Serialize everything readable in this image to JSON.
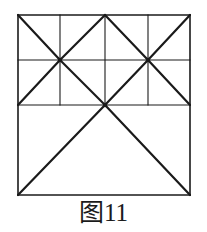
{
  "figure": {
    "caption_cjk": "图",
    "caption_number": "11",
    "caption_full": "图11",
    "stroke_color": "#1a1a1a",
    "background_color": "#ffffff",
    "thin_stroke_width": 1.1,
    "thick_stroke_width": 2.2,
    "outer_square": {
      "left": 18,
      "top": 15,
      "right": 190,
      "bottom": 195,
      "width": 172,
      "height": 180
    },
    "grid": {
      "vertical_x": [
        18,
        60,
        105,
        148,
        190
      ],
      "horizontal_y": [
        15,
        60,
        105,
        195
      ]
    },
    "nodes": [
      {
        "name": "node-upper-left",
        "x": 60,
        "y": 60,
        "degree": 8
      },
      {
        "name": "node-upper-right",
        "x": 148,
        "y": 60,
        "degree": 8
      },
      {
        "name": "node-center-apex",
        "x": 105,
        "y": 105,
        "degree": 6
      }
    ],
    "segments": {
      "outline": [
        {
          "name": "outer-top",
          "x1": 18,
          "y1": 15,
          "x2": 190,
          "y2": 15
        },
        {
          "name": "outer-bottom",
          "x1": 18,
          "y1": 195,
          "x2": 190,
          "y2": 195
        },
        {
          "name": "outer-left",
          "x1": 18,
          "y1": 15,
          "x2": 18,
          "y2": 195
        },
        {
          "name": "outer-right",
          "x1": 190,
          "y1": 15,
          "x2": 190,
          "y2": 195
        }
      ],
      "horizontals": [
        {
          "name": "mid-upper-horizontal",
          "x1": 18,
          "y1": 60,
          "x2": 190,
          "y2": 60
        },
        {
          "name": "mid-lower-horizontal",
          "x1": 18,
          "y1": 105,
          "x2": 190,
          "y2": 105
        }
      ],
      "verticals": [
        {
          "name": "vertical-col-1-upper",
          "x1": 60,
          "y1": 15,
          "x2": 60,
          "y2": 105
        },
        {
          "name": "vertical-col-2-upper",
          "x1": 105,
          "y1": 15,
          "x2": 105,
          "y2": 105
        },
        {
          "name": "vertical-col-3-upper",
          "x1": 148,
          "y1": 15,
          "x2": 148,
          "y2": 105
        }
      ],
      "diagonals": [
        {
          "name": "diag-tl-corner-to-node1",
          "x1": 18,
          "y1": 15,
          "x2": 60,
          "y2": 60
        },
        {
          "name": "diag-node1-to-top-mid",
          "x1": 60,
          "y1": 60,
          "x2": 105,
          "y2": 15
        },
        {
          "name": "diag-top-mid-to-node2",
          "x1": 105,
          "y1": 15,
          "x2": 148,
          "y2": 60
        },
        {
          "name": "diag-node2-to-tr-corner",
          "x1": 148,
          "y1": 60,
          "x2": 190,
          "y2": 15
        },
        {
          "name": "diag-node1-to-left-lower",
          "x1": 60,
          "y1": 60,
          "x2": 18,
          "y2": 105
        },
        {
          "name": "diag-node1-to-center-apex",
          "x1": 60,
          "y1": 60,
          "x2": 105,
          "y2": 105
        },
        {
          "name": "diag-center-apex-to-node2",
          "x1": 105,
          "y1": 105,
          "x2": 148,
          "y2": 60
        },
        {
          "name": "diag-node2-to-right-lower",
          "x1": 148,
          "y1": 60,
          "x2": 190,
          "y2": 105
        },
        {
          "name": "diag-apex-to-bottom-left",
          "x1": 105,
          "y1": 105,
          "x2": 18,
          "y2": 195
        },
        {
          "name": "diag-apex-to-bottom-right",
          "x1": 105,
          "y1": 105,
          "x2": 190,
          "y2": 195
        }
      ]
    }
  }
}
